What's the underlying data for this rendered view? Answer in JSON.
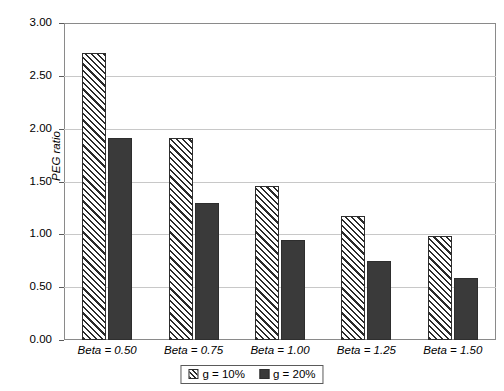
{
  "chart_data": {
    "type": "bar",
    "title": "",
    "xlabel": "",
    "ylabel": "PEG ratio",
    "ylim": [
      0.0,
      3.0
    ],
    "ytick_step": 0.5,
    "ytick_labels": [
      "0.00",
      "0.50",
      "1.00",
      "1.50",
      "2.00",
      "2.50",
      "3.00"
    ],
    "ytick_values": [
      0.0,
      0.5,
      1.0,
      1.5,
      2.0,
      2.5,
      3.0
    ],
    "grid": "horizontal",
    "legend_position": "bottom-center",
    "categories": [
      "Beta = 0.50",
      "Beta = 0.75",
      "Beta = 1.00",
      "Beta = 1.25",
      "Beta = 1.50"
    ],
    "series": [
      {
        "name": "g = 10%",
        "fill": "diagonal-hatch",
        "color": "#2b2b2b",
        "values": [
          2.72,
          1.91,
          1.46,
          1.17,
          0.98
        ]
      },
      {
        "name": "g = 20%",
        "fill": "solid",
        "color": "#3a3a3a",
        "values": [
          1.91,
          1.3,
          0.95,
          0.75,
          0.59
        ]
      }
    ]
  },
  "axes": {
    "frame_color": "#8a8a8a",
    "grid_color": "#c8c8c8",
    "tick_color": "#5a5a5a"
  },
  "legend": {
    "items": [
      "g = 10%",
      "g = 20%"
    ]
  }
}
